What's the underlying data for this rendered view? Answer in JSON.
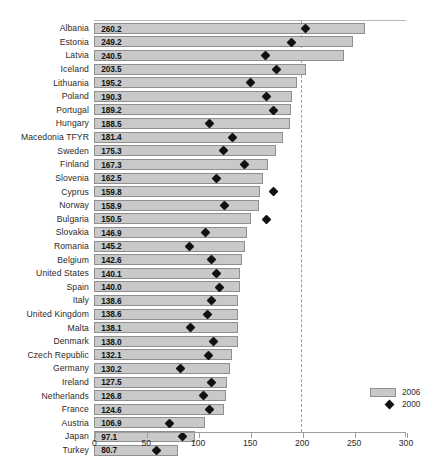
{
  "chart_data": {
    "type": "bar",
    "title": "",
    "subtitle": "",
    "xlabel": "",
    "ylabel": "",
    "orientation": "horizontal",
    "xlim": [
      0,
      300
    ],
    "xticks": [
      0,
      50,
      100,
      150,
      200,
      250,
      300
    ],
    "xtick_labels": [
      "0",
      "50",
      "100",
      "150",
      "200",
      "250",
      "300"
    ],
    "grid": false,
    "reference_line": 200,
    "legend_position": "bottom-right",
    "legend": [
      {
        "label": "2006",
        "marker": "bar",
        "color": "#c9c9c9"
      },
      {
        "label": "2000",
        "marker": "diamond",
        "color": "#111111"
      }
    ],
    "categories": [
      "Albania",
      "Estonia",
      "Latvia",
      "Iceland",
      "Lithuania",
      "Poland",
      "Portugal",
      "Hungary",
      "Macedonia TFYR",
      "Sweden",
      "Finland",
      "Slovenia",
      "Cyprus",
      "Norway",
      "Bulgaria",
      "Slovakia",
      "Romania",
      "Belgium",
      "United States",
      "Spain",
      "Italy",
      "United Kingdom",
      "Malta",
      "Denmark",
      "Czech Republic",
      "Germany",
      "Ireland",
      "Netherlands",
      "France",
      "Austria",
      "Japan",
      "Turkey"
    ],
    "series": [
      {
        "name": "2006",
        "type": "bar",
        "values": [
          260.2,
          249.2,
          240.5,
          203.5,
          195.2,
          190.3,
          189.2,
          188.5,
          181.4,
          175.3,
          167.3,
          162.5,
          159.8,
          158.9,
          150.5,
          146.9,
          145.2,
          142.6,
          140.1,
          140.0,
          138.6,
          138.6,
          138.1,
          138.0,
          132.1,
          130.2,
          127.5,
          126.8,
          124.6,
          106.9,
          97.1,
          80.7
        ],
        "labels": [
          "260.2",
          "249.2",
          "240.5",
          "203.5",
          "195.2",
          "190.3",
          "189.2",
          "188.5",
          "181.4",
          "175.3",
          "167.3",
          "162.5",
          "159.8",
          "158.9",
          "150.5",
          "146.9",
          "145.2",
          "142.6",
          "140.1",
          "140.0",
          "138.6",
          "138.6",
          "138.1",
          "138.0",
          "132.1",
          "130.2",
          "127.5",
          "126.8",
          "124.6",
          "106.9",
          "97.1",
          "80.7"
        ]
      },
      {
        "name": "2000",
        "type": "diamond-marker",
        "values": [
          203.0,
          190.0,
          165.0,
          175.5,
          150.0,
          166.0,
          172.0,
          111.0,
          133.0,
          124.0,
          145.0,
          117.5,
          172.0,
          125.0,
          166.0,
          107.5,
          92.0,
          112.5,
          118.0,
          120.5,
          113.0,
          108.5,
          92.5,
          115.0,
          110.0,
          82.5,
          113.0,
          105.0,
          111.0,
          72.0,
          84.5,
          60.0
        ]
      }
    ]
  },
  "legend": {
    "items": [
      {
        "label": "2006"
      },
      {
        "label": "2000"
      }
    ]
  }
}
